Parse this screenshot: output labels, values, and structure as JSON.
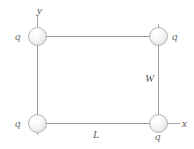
{
  "figure": {
    "background_color": "#ffffff",
    "line_color": "#9a9a9a",
    "sphere_fill": "#f1f1f1",
    "sphere_stroke": "#b5b5b5",
    "label_color": "#6f6f6f"
  },
  "charges": [
    {
      "id": "top-left",
      "label": "q",
      "x": 37,
      "y": 36
    },
    {
      "id": "top-right",
      "label": "q",
      "x": 158,
      "y": 36
    },
    {
      "id": "bottom-left",
      "label": "q",
      "x": 37,
      "y": 123
    },
    {
      "id": "bottom-right",
      "label": "q",
      "x": 158,
      "y": 123
    }
  ],
  "axes": {
    "y_label": "y",
    "x_label": "x"
  },
  "dimensions": {
    "width_label": "W",
    "length_label": "L"
  }
}
